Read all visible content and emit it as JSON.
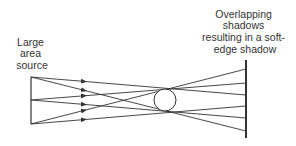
{
  "diagram": {
    "source_label": [
      "Large",
      "area",
      "source"
    ],
    "shadow_label": [
      "Overlapping",
      "shadows",
      "resulting in a soft-",
      "edge shadow"
    ],
    "colors": {
      "line": "#333333",
      "background": "#ffffff"
    },
    "source": {
      "x": 31,
      "y_top": 77,
      "y_bottom": 124
    },
    "object": {
      "shape": "circle",
      "cx": 165,
      "cy": 100,
      "r": 11
    },
    "screen": {
      "x": 246,
      "y_top": 60,
      "y_bottom": 138
    },
    "rays": [
      {
        "from": [
          31,
          77
        ],
        "to": [
          246,
          95
        ]
      },
      {
        "from": [
          31,
          77
        ],
        "to": [
          246,
          131
        ]
      },
      {
        "from": [
          31,
          100
        ],
        "to": [
          246,
          83
        ]
      },
      {
        "from": [
          31,
          100
        ],
        "to": [
          246,
          118
        ]
      },
      {
        "from": [
          31,
          124
        ],
        "to": [
          246,
          69
        ]
      },
      {
        "from": [
          31,
          124
        ],
        "to": [
          246,
          106
        ]
      }
    ]
  }
}
